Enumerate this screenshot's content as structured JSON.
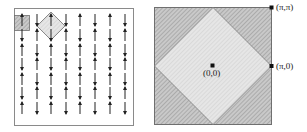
{
  "left_panel": {
    "title": "",
    "columns_x": [
      22,
      37,
      51,
      66,
      80,
      95,
      110,
      125
    ],
    "rows_y": [
      20,
      35,
      50,
      64,
      79,
      93,
      108
    ],
    "first_column_direction": "up",
    "arrow_pattern": "staggered up/down spins alternating by column and row"
  },
  "right_panel": {
    "labels": {
      "corner": "(π,π)",
      "edge": "(π,0)",
      "center": "(0,0)"
    }
  },
  "colors": {
    "frame": "#6f6f6f",
    "hatch_dark": "#9a9a9a",
    "hatch_light": "#cfcfcf",
    "fill_light": "#e2e2e2",
    "fill_dark": "#c8c8c8",
    "arrow": "#222222"
  }
}
